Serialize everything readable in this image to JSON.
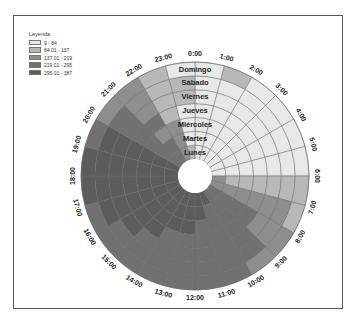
{
  "legend": {
    "title": "Leyenda",
    "items": [
      {
        "label": "9 - 84",
        "color": "#e8e8e8"
      },
      {
        "label": "84.01 - 137",
        "color": "#b8b8b8"
      },
      {
        "label": "137.01 - 219",
        "color": "#8e8e8e"
      },
      {
        "label": "219.01 - 295",
        "color": "#717171"
      },
      {
        "label": "295.01 - 387",
        "color": "#5c5c5c"
      }
    ]
  },
  "chart_data": {
    "type": "heatmap",
    "subtype": "radial-heatmap",
    "title": "",
    "legend_title": "Leyenda",
    "legend_position": "top-left",
    "class_breaks": [
      "9 - 84",
      "84.01 - 137",
      "137.01 - 219",
      "219.01 - 295",
      "295.01 - 387"
    ],
    "rings_inner_to_outer": [
      "Lunes",
      "Martes",
      "Miércoles",
      "Jueves",
      "Viernes",
      "Sábado",
      "Domingo"
    ],
    "hours": [
      "0:00",
      "1:00",
      "2:00",
      "3:00",
      "4:00",
      "5:00",
      "6:00",
      "7:00",
      "8:00",
      "9:00",
      "10:00",
      "11:00",
      "12:00",
      "13:00",
      "14:00",
      "15:00",
      "16:00",
      "17:00",
      "18:00",
      "19:00",
      "20:00",
      "21:00",
      "22:00",
      "23:00"
    ],
    "class_by_hour_ring": [
      [
        1,
        1,
        1,
        1,
        1,
        1,
        1
      ],
      [
        1,
        1,
        1,
        1,
        1,
        1,
        2
      ],
      [
        1,
        1,
        1,
        1,
        1,
        1,
        1
      ],
      [
        1,
        1,
        1,
        1,
        1,
        1,
        1
      ],
      [
        1,
        1,
        1,
        1,
        1,
        1,
        1
      ],
      [
        1,
        1,
        1,
        1,
        1,
        1,
        1
      ],
      [
        3,
        2,
        2,
        2,
        2,
        2,
        2
      ],
      [
        3,
        3,
        3,
        3,
        3,
        3,
        2
      ],
      [
        4,
        4,
        4,
        4,
        3,
        3,
        3
      ],
      [
        4,
        4,
        4,
        4,
        4,
        4,
        3
      ],
      [
        5,
        4,
        4,
        4,
        4,
        4,
        4
      ],
      [
        5,
        5,
        4,
        4,
        4,
        4,
        4
      ],
      [
        5,
        5,
        5,
        4,
        4,
        4,
        4
      ],
      [
        5,
        5,
        5,
        4,
        4,
        4,
        4
      ],
      [
        5,
        5,
        5,
        5,
        4,
        4,
        4
      ],
      [
        5,
        5,
        5,
        5,
        5,
        4,
        4
      ],
      [
        5,
        5,
        5,
        5,
        5,
        5,
        4
      ],
      [
        5,
        5,
        5,
        5,
        5,
        5,
        5
      ],
      [
        5,
        5,
        5,
        5,
        5,
        5,
        5
      ],
      [
        5,
        5,
        5,
        5,
        5,
        5,
        4
      ],
      [
        4,
        4,
        4,
        4,
        4,
        4,
        3
      ],
      [
        4,
        4,
        3,
        4,
        3,
        3,
        3
      ],
      [
        3,
        3,
        3,
        2,
        2,
        2,
        2
      ],
      [
        2,
        1,
        1,
        1,
        2,
        2,
        1
      ]
    ],
    "geometry": {
      "cx": 195,
      "cy": 176,
      "inner_radius": 17,
      "outer_radius": 114,
      "label_radius": 122
    }
  }
}
